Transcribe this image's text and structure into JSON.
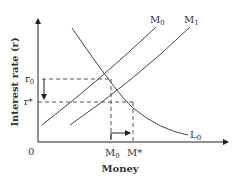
{
  "diagram": {
    "y_axis_label": "Interest rate (r)",
    "x_axis_label": "Money",
    "origin_label": "0",
    "y_ticks": [
      {
        "main": "r",
        "sub": "0"
      },
      {
        "main": "r*",
        "sub": ""
      }
    ],
    "x_ticks": [
      {
        "main": "M",
        "sub": "0"
      },
      {
        "main": "M*",
        "sub": ""
      }
    ],
    "curves": [
      {
        "main": "M",
        "sub": "0",
        "role": "money supply (initial)"
      },
      {
        "main": "M",
        "sub": "1",
        "role": "money supply (shifted)"
      },
      {
        "main": "L",
        "sub": "0",
        "role": "money demand"
      }
    ],
    "annotations": [
      "arrow from r0 down to r*",
      "arrow from M0 right to M*"
    ],
    "colors": {
      "line": "#3a3a3a",
      "text": "#333333"
    }
  }
}
